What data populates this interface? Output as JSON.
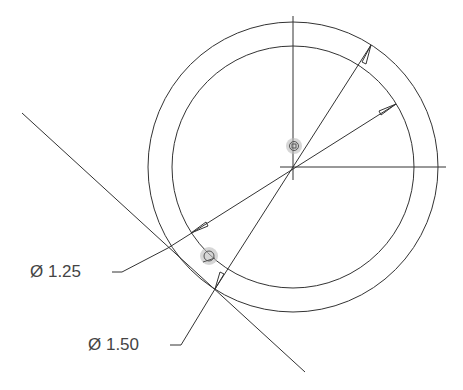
{
  "drawing": {
    "center": [
      293,
      167
    ],
    "outer_circle_radius": 145,
    "inner_circle_radius": 121,
    "line_color": "#333333",
    "snap_color": "#999999"
  },
  "dimensions": [
    {
      "symbol": "Ø",
      "value": "1.25",
      "text": "Ø 1.25"
    },
    {
      "symbol": "Ø",
      "value": "1.50",
      "text": "Ø 1.50"
    }
  ],
  "snap_markers": [
    {
      "type": "center-snap",
      "icon": "square-in-circle"
    },
    {
      "type": "tangent-snap",
      "icon": "tangent-circle"
    }
  ]
}
